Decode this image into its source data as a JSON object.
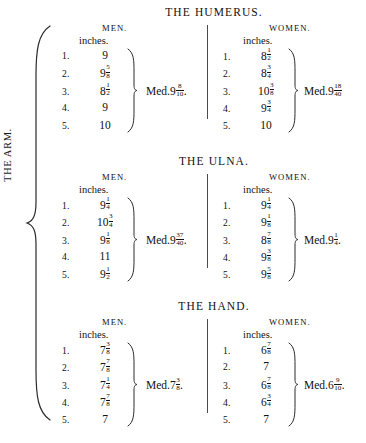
{
  "document": {
    "group_label": "THE ARM.",
    "unit_label": "inches.",
    "median_prefix": "Med. ",
    "col_men": "MEN.",
    "col_women": "WOMEN."
  },
  "sections": [
    {
      "id": "humerus",
      "title_words": [
        "THE",
        "HUMERUS."
      ],
      "title": "THE HUMERUS.",
      "men": {
        "heading": "MEN.",
        "unit": "inches.",
        "rows": [
          {
            "index": "1.",
            "whole": "9",
            "num": "",
            "den": ""
          },
          {
            "index": "2.",
            "whole": "9",
            "num": "5",
            "den": "8"
          },
          {
            "index": "3.",
            "whole": "8",
            "num": "1",
            "den": "2"
          },
          {
            "index": "4.",
            "whole": "9",
            "num": "",
            "den": ""
          },
          {
            "index": "5.",
            "whole": "10",
            "num": "",
            "den": ""
          }
        ],
        "median": {
          "whole": "9",
          "num": "8",
          "den": "10",
          "trailing": "."
        }
      },
      "women": {
        "heading": "WOMEN.",
        "unit": "inches.",
        "rows": [
          {
            "index": "1.",
            "whole": "8",
            "num": "1",
            "den": "2"
          },
          {
            "index": "2.",
            "whole": "8",
            "num": "3",
            "den": "4"
          },
          {
            "index": "3.",
            "whole": "10",
            "num": "3",
            "den": "8"
          },
          {
            "index": "4.",
            "whole": "9",
            "num": "3",
            "den": "4"
          },
          {
            "index": "5.",
            "whole": "10",
            "num": "",
            "den": ""
          }
        ],
        "median": {
          "whole": "9",
          "num": "18",
          "den": "40",
          "trailing": ""
        }
      }
    },
    {
      "id": "ulna",
      "title_words": [
        "THE",
        "ULNA."
      ],
      "title": "THE ULNA.",
      "men": {
        "heading": "MEN.",
        "unit": "inches.",
        "rows": [
          {
            "index": "1.",
            "whole": "9",
            "num": "1",
            "den": "4"
          },
          {
            "index": "2.",
            "whole": "10",
            "num": "3",
            "den": "4"
          },
          {
            "index": "3.",
            "whole": "9",
            "num": "1",
            "den": "8"
          },
          {
            "index": "4.",
            "whole": "11",
            "num": "",
            "den": ""
          },
          {
            "index": "5.",
            "whole": "9",
            "num": "1",
            "den": "2"
          }
        ],
        "median": {
          "whole": "9",
          "num": "37",
          "den": "40",
          "trailing": "."
        }
      },
      "women": {
        "heading": "WOMEN.",
        "unit": "inches.",
        "rows": [
          {
            "index": "1.",
            "whole": "9",
            "num": "1",
            "den": "4"
          },
          {
            "index": "2.",
            "whole": "9",
            "num": "1",
            "den": "8"
          },
          {
            "index": "3.",
            "whole": "8",
            "num": "7",
            "den": "8"
          },
          {
            "index": "4.",
            "whole": "9",
            "num": "3",
            "den": "8"
          },
          {
            "index": "5.",
            "whole": "9",
            "num": "5",
            "den": "8"
          }
        ],
        "median": {
          "whole": "9",
          "num": "1",
          "den": "4",
          "trailing": "."
        }
      }
    },
    {
      "id": "hand",
      "title_words": [
        "THE",
        "HAND."
      ],
      "title": "THE HAND.",
      "men": {
        "heading": "MEN.",
        "unit": "inches.",
        "rows": [
          {
            "index": "1.",
            "whole": "7",
            "num": "3",
            "den": "8"
          },
          {
            "index": "2.",
            "whole": "7",
            "num": "7",
            "den": "8"
          },
          {
            "index": "3.",
            "whole": "7",
            "num": "1",
            "den": "4"
          },
          {
            "index": "4.",
            "whole": "7",
            "num": "7",
            "den": "8"
          },
          {
            "index": "5.",
            "whole": "7",
            "num": "",
            "den": ""
          }
        ],
        "median": {
          "whole": "7",
          "num": "3",
          "den": "8",
          "trailing": "."
        }
      },
      "women": {
        "heading": "WOMEN.",
        "unit": "inches.",
        "rows": [
          {
            "index": "1.",
            "whole": "6",
            "num": "7",
            "den": "8"
          },
          {
            "index": "2.",
            "whole": "7",
            "num": "",
            "den": ""
          },
          {
            "index": "3.",
            "whole": "6",
            "num": "7",
            "den": "8"
          },
          {
            "index": "4.",
            "whole": "6",
            "num": "3",
            "den": "4"
          },
          {
            "index": "5.",
            "whole": "7",
            "num": "",
            "den": ""
          }
        ],
        "median": {
          "whole": "6",
          "num": "9",
          "den": "10",
          "trailing": "."
        }
      }
    }
  ]
}
